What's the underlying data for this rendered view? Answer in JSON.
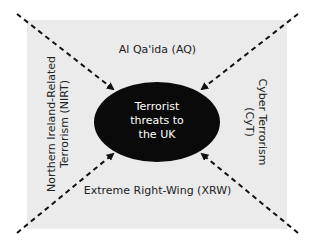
{
  "diagram": {
    "center": {
      "lines": [
        "Terrorist",
        "threats to",
        "the UK"
      ]
    },
    "threats": {
      "top": {
        "label": "Al Qa'ida (AQ)"
      },
      "left": {
        "lines": [
          "Northern Ireland-Related",
          "Terrorism (NIRT)"
        ]
      },
      "right": {
        "lines": [
          "Cyber Terrorism",
          "(CyT)"
        ]
      },
      "bottom": {
        "label": "Extreme Right-Wing (XRW)"
      }
    },
    "colors": {
      "background": "#ebebeb",
      "ellipse": "#0a0a0a",
      "arrow": "#111111",
      "center_text": "#ffffff"
    }
  }
}
